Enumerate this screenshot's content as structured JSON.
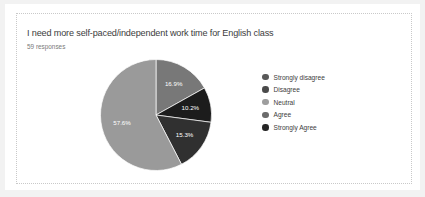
{
  "card": {
    "title": "I need more self-paced/independent work time for English class",
    "responses": "59 responses"
  },
  "legend": {
    "items": [
      {
        "label": "Strongly disagree",
        "color": "#595959"
      },
      {
        "label": "Disagree",
        "color": "#4a4a4a"
      },
      {
        "label": "Neutral",
        "color": "#9e9e9e"
      },
      {
        "label": "Agree",
        "color": "#6b6b6b"
      },
      {
        "label": "Strongly Agree",
        "color": "#262626"
      }
    ]
  },
  "chart_data": {
    "type": "pie",
    "title": "I need more self-paced/independent work time for English class",
    "subtitle": "59 responses",
    "total_responses": 59,
    "legend_position": "right",
    "start_angle_deg": 0,
    "direction": "clockwise",
    "categories": [
      "Strongly disagree",
      "Disagree",
      "Neutral",
      "Agree",
      "Strongly Agree"
    ],
    "values": [
      16.9,
      10.2,
      15.3,
      57.6,
      0
    ],
    "labels": [
      "16.9%",
      "10.2%",
      "15.3%",
      "57.6%",
      ""
    ],
    "colors": [
      "#787878",
      "#1c1c1c",
      "#303030",
      "#9a9a9a",
      "#262626"
    ],
    "slices": [
      {
        "name": "Strongly disagree",
        "value": 16.9,
        "label": "16.9%",
        "color": "#787878"
      },
      {
        "name": "Disagree",
        "value": 10.2,
        "label": "10.2%",
        "color": "#1c1c1c"
      },
      {
        "name": "Neutral",
        "value": 15.3,
        "label": "15.3%",
        "color": "#303030"
      },
      {
        "name": "Agree",
        "value": 57.6,
        "label": "57.6%",
        "color": "#9a9a9a"
      },
      {
        "name": "Strongly Agree",
        "value": 0,
        "label": "",
        "color": "#262626"
      }
    ]
  }
}
